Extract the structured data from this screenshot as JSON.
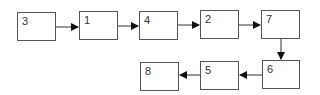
{
  "nodes": [
    {
      "id": "n3",
      "label": "3",
      "x": 17,
      "y": 12,
      "w": 39,
      "h": 29
    },
    {
      "id": "n1",
      "label": "1",
      "x": 79,
      "y": 11,
      "w": 39,
      "h": 29
    },
    {
      "id": "n4",
      "label": "4",
      "x": 139,
      "y": 11,
      "w": 39,
      "h": 29
    },
    {
      "id": "n2",
      "label": "2",
      "x": 200,
      "y": 10,
      "w": 39,
      "h": 29
    },
    {
      "id": "n7",
      "label": "7",
      "x": 261,
      "y": 10,
      "w": 39,
      "h": 29
    },
    {
      "id": "n6",
      "label": "6",
      "x": 262,
      "y": 60,
      "w": 38,
      "h": 29
    },
    {
      "id": "n5",
      "label": "5",
      "x": 200,
      "y": 61,
      "w": 39,
      "h": 29
    },
    {
      "id": "n8",
      "label": "8",
      "x": 140,
      "y": 62,
      "w": 39,
      "h": 29
    }
  ],
  "edges": [
    {
      "from": "3",
      "to": "1"
    },
    {
      "from": "1",
      "to": "4"
    },
    {
      "from": "4",
      "to": "2"
    },
    {
      "from": "2",
      "to": "7"
    },
    {
      "from": "7",
      "to": "6"
    },
    {
      "from": "6",
      "to": "5"
    },
    {
      "from": "5",
      "to": "8"
    }
  ],
  "colors": {
    "stroke": "#555555",
    "text": "#333333",
    "background": "#ffffff"
  }
}
